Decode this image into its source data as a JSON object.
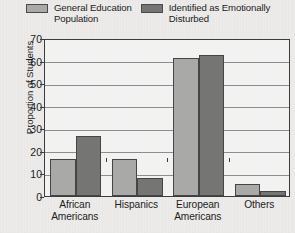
{
  "chart_data": {
    "type": "bar",
    "title": "",
    "xlabel": "",
    "ylabel": "Proportion of Students",
    "categories": [
      "African\nAmericans",
      "Hispanics",
      "European\nAmericans",
      "Others"
    ],
    "series": [
      {
        "name": "General Education\nPopulation",
        "color": "#a9a9a7",
        "values": [
          16.5,
          16.3,
          61.0,
          5.2
        ]
      },
      {
        "name": "Identified as Emotionally\nDisturbed",
        "color": "#757573",
        "values": [
          26.5,
          8.0,
          62.5,
          2.3
        ]
      }
    ],
    "ylim": [
      0,
      70
    ],
    "yticks": [
      0,
      10,
      20,
      30,
      40,
      50,
      60,
      70
    ],
    "ytick_labels": [
      "0",
      "10",
      "20",
      "30",
      "40",
      "50",
      "60",
      "70"
    ],
    "grid": true,
    "legend_position": "top"
  },
  "legend": {
    "entries": [
      {
        "label": "General Education\nPopulation",
        "color": "#a9a9a7"
      },
      {
        "label": "Identified as Emotionally\nDisturbed",
        "color": "#757573"
      }
    ]
  },
  "axes": {
    "y_title": "Proportion of Students"
  }
}
